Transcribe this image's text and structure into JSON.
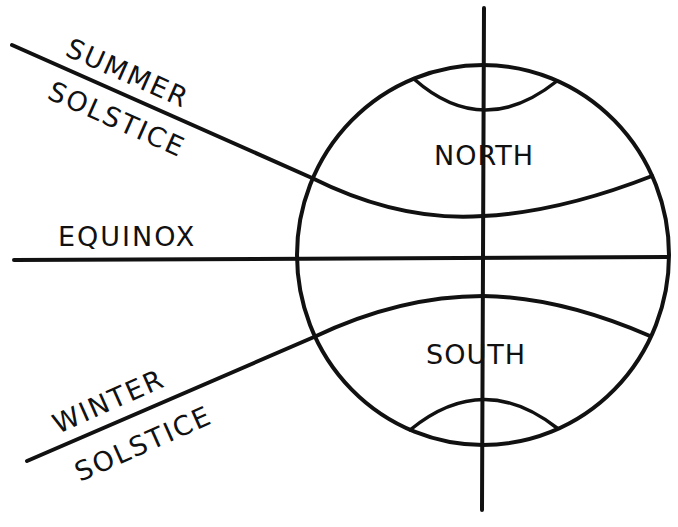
{
  "diagram": {
    "labels": {
      "summer_1": "SUMMER",
      "summer_2": "SOLSTICE",
      "equinox": "EQUINOX",
      "winter_1": "WINTER",
      "winter_2": "SOLSTICE",
      "north": "NORTH",
      "south": "SOUTH"
    },
    "colors": {
      "ink": "#111111",
      "background": "#ffffff"
    }
  }
}
